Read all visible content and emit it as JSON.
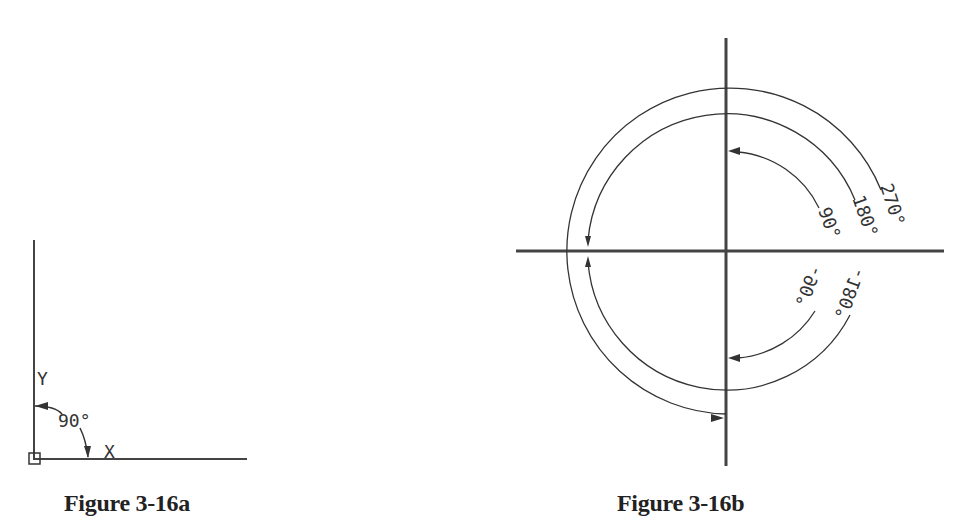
{
  "figures": [
    {
      "id": "3-16a",
      "caption": "Figure 3-16a",
      "axis_labels": {
        "x": "X",
        "y": "Y"
      },
      "angle_label": "90°",
      "description": "UCS icon with 90° angle measured clockwise from Y to X"
    },
    {
      "id": "3-16b",
      "caption": "Figure 3-16b",
      "arcs": [
        {
          "label": "90°",
          "direction": "counterclockwise"
        },
        {
          "label": "180°",
          "direction": "counterclockwise"
        },
        {
          "label": "270°",
          "direction": "counterclockwise"
        },
        {
          "label": "-90°",
          "direction": "clockwise"
        },
        {
          "label": "-180°",
          "direction": "clockwise"
        }
      ]
    }
  ],
  "colors": {
    "line": "#333333",
    "axis": "#444444",
    "text": "#222222"
  }
}
